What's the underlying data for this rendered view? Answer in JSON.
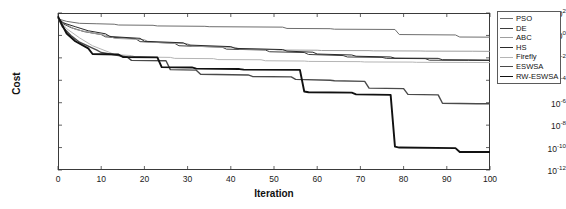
{
  "chart_data": {
    "type": "line",
    "title": "",
    "xlabel": "Iteration",
    "ylabel": "Cost",
    "xlim": [
      0,
      100
    ],
    "ylim": [
      1e-12,
      100
    ],
    "yscale": "log",
    "grid": false,
    "legend_position": "right-outside",
    "xticks": [
      0,
      10,
      20,
      30,
      40,
      50,
      60,
      70,
      80,
      90,
      100
    ],
    "yticks": [
      100,
      1,
      0.01,
      0.0001,
      1e-06,
      1e-08,
      1e-10,
      1e-12
    ],
    "ytick_labels": [
      "10^2",
      "10^0",
      "10^-2",
      "10^-4",
      "10^-6",
      "10^-8",
      "10^-10",
      "10^-12"
    ],
    "ytick_mantissa": [
      "10",
      "10",
      "10",
      "10",
      "10",
      "10",
      "10",
      "10"
    ],
    "ytick_exponent": [
      "2",
      "0",
      "-2",
      "-4",
      "-6",
      "-8",
      "-10",
      "-12"
    ],
    "series": [
      {
        "name": "PSO",
        "color": "#6e6e6e",
        "width": 1.0,
        "x": [
          0,
          2,
          5,
          9,
          13,
          14,
          22,
          23,
          34,
          35,
          52,
          53,
          63,
          64,
          78,
          79,
          92,
          93,
          100
        ],
        "y": [
          30,
          18,
          12,
          11,
          10,
          8.5,
          8.0,
          7.0,
          6.5,
          6.0,
          5.5,
          4.2,
          4.0,
          3.6,
          3.4,
          1.2,
          1.1,
          0.72,
          0.7
        ]
      },
      {
        "name": "DE",
        "color": "#3d3d3d",
        "width": 1.0,
        "x": [
          0,
          1,
          3,
          6,
          10,
          11,
          18,
          19,
          27,
          28,
          38,
          39,
          48,
          49,
          57,
          58,
          66,
          67,
          75,
          76,
          85,
          86,
          95,
          100
        ],
        "y": [
          40,
          12,
          5.0,
          2.2,
          1.2,
          0.75,
          0.5,
          0.28,
          0.2,
          0.12,
          0.09,
          0.06,
          0.05,
          0.035,
          0.03,
          0.02,
          0.016,
          0.012,
          0.011,
          0.009,
          0.0085,
          0.0062,
          0.006,
          0.0058
        ]
      },
      {
        "name": "ABC",
        "color": "#9e9e9e",
        "width": 1.0,
        "x": [
          0,
          2,
          4,
          8,
          12,
          13,
          20,
          21,
          30,
          31,
          41,
          42,
          50,
          51,
          60,
          61,
          72,
          73,
          84,
          85,
          96,
          100
        ],
        "y": [
          35,
          9,
          3.5,
          1.6,
          0.9,
          0.55,
          0.42,
          0.25,
          0.18,
          0.11,
          0.085,
          0.062,
          0.055,
          0.05,
          0.048,
          0.045,
          0.044,
          0.042,
          0.041,
          0.04,
          0.039,
          0.038
        ]
      },
      {
        "name": "HS",
        "color": "#2a2a2a",
        "width": 1.0,
        "x": [
          0,
          1,
          4,
          7,
          11,
          12,
          19,
          20,
          29,
          30,
          40,
          41,
          52,
          53,
          59,
          60,
          68,
          69,
          77,
          78,
          88,
          89,
          97,
          100
        ],
        "y": [
          45,
          14,
          6.0,
          2.6,
          1.4,
          0.8,
          0.55,
          0.3,
          0.22,
          0.14,
          0.1,
          0.07,
          0.055,
          0.04,
          0.032,
          0.022,
          0.018,
          0.014,
          0.012,
          0.0095,
          0.009,
          0.0068,
          0.0065,
          0.0063
        ]
      },
      {
        "name": "Firefly",
        "color": "#b5b5b5",
        "width": 1.0,
        "x": [
          0,
          2,
          5,
          8,
          12,
          13,
          17,
          18,
          26,
          27,
          36,
          37,
          47,
          48,
          57,
          58,
          70,
          71,
          82,
          83,
          94,
          100
        ],
        "y": [
          32,
          4.0,
          0.6,
          0.12,
          0.03,
          0.02,
          0.016,
          0.012,
          0.011,
          0.009,
          0.0085,
          0.007,
          0.0068,
          0.0055,
          0.0052,
          0.0048,
          0.0046,
          0.0043,
          0.0042,
          0.004,
          0.0039,
          0.0038
        ]
      },
      {
        "name": "ESWSA",
        "color": "#4a4a4a",
        "width": 1.4,
        "x": [
          0,
          1,
          3,
          5,
          9,
          10,
          16,
          17,
          25,
          26,
          32,
          33,
          44,
          45,
          54,
          55,
          63,
          64,
          71,
          72,
          80,
          81,
          88,
          89,
          97,
          100
        ],
        "y": [
          38,
          6.0,
          1.0,
          0.25,
          0.05,
          0.03,
          0.012,
          0.006,
          0.0055,
          0.0009,
          0.0008,
          0.00035,
          0.0003,
          0.00022,
          0.0002,
          0.00012,
          0.0001,
          9e-05,
          8e-05,
          2e-05,
          1.8e-05,
          5.5e-06,
          5e-06,
          9e-07,
          8e-07,
          8e-07
        ]
      },
      {
        "name": "RW-ESWSA",
        "color": "#111111",
        "width": 1.9,
        "x": [
          0,
          1,
          2,
          4,
          7,
          8,
          14,
          15,
          23,
          24,
          31,
          32,
          42,
          43,
          56,
          57,
          58,
          68,
          69,
          77,
          78,
          79,
          92,
          93,
          100
        ],
        "y": [
          50,
          8.0,
          1.5,
          0.3,
          0.07,
          0.022,
          0.02,
          0.012,
          0.011,
          0.0015,
          0.0014,
          0.0011,
          0.001,
          0.0009,
          0.00085,
          1e-05,
          8.5e-06,
          8e-06,
          5.5e-06,
          5e-06,
          1.2e-10,
          1e-10,
          9e-11,
          4e-11,
          4e-11
        ]
      }
    ]
  }
}
